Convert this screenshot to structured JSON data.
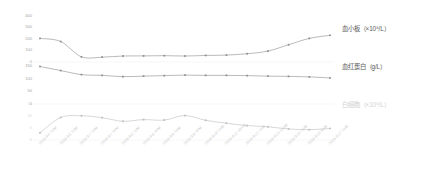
{
  "chart_data": {
    "type": "line",
    "title": "",
    "xlabel": "",
    "ylabel": "",
    "grid": false,
    "legend_position": "right",
    "x": [
      "2019-9-5 7AM",
      "2019-9-6 7AM",
      "2019-9-7 7AM",
      "2019-9-7 7PM",
      "2019-9-8 7AM",
      "2019-9-8 7PM",
      "2019-9-9 7AM",
      "2019-9-9 7PM",
      "2019-9-10 7AM",
      "2019-9-11 10AM",
      "2019-9-12 7AM",
      "2019-9-13 10AM",
      "2019-9-15 7AM",
      "2019-9-16 9AM",
      "2019-9-17 7AM"
    ],
    "series": [
      {
        "name": "血小板（×10⁹/L）",
        "color": "#8c8c8c",
        "axis": "platelet",
        "ylim": [
          0,
          400
        ],
        "yticks": [
          0,
          100,
          200,
          300,
          400
        ],
        "values": [
          205,
          178,
          45,
          42,
          52,
          53,
          55,
          52,
          57,
          60,
          72,
          95,
          150,
          205,
          232
        ]
      },
      {
        "name": "血红蛋白（g/L）",
        "color": "#8c8c8c",
        "axis": "hemoglobin",
        "ylim": [
          0,
          150
        ],
        "yticks": [
          0,
          50,
          100,
          150
        ],
        "values": [
          148,
          132,
          116,
          113,
          108,
          110,
          112,
          114,
          113,
          113,
          112,
          110,
          109,
          107,
          103
        ]
      },
      {
        "name": "白细胞（×10⁹/L）",
        "color": "#bdbdbd",
        "axis": "wbc",
        "ylim": [
          0,
          15
        ],
        "yticks": [
          0,
          5,
          10,
          15
        ],
        "values": [
          3.0,
          9.4,
          10.1,
          9.3,
          7.8,
          8.5,
          8.3,
          10.2,
          8.2,
          7.0,
          6.0,
          5.5,
          4.6,
          4.3,
          4.8
        ]
      }
    ],
    "y_axis_groups": [
      {
        "name": "platelet-axis",
        "ticks": [
          "400",
          "300",
          "200",
          "100",
          "0"
        ]
      },
      {
        "name": "hemoglobin-axis",
        "ticks": [
          "150",
          "100",
          "50",
          "0"
        ]
      },
      {
        "name": "wbc-axis",
        "ticks": [
          "15",
          "10",
          "5",
          "0"
        ]
      }
    ]
  },
  "legend": {
    "platelet": "血小板（×10⁹/L）",
    "hemoglobin": "血红蛋白（g/L）",
    "wbc": "白细胞（×10⁹/L）"
  }
}
